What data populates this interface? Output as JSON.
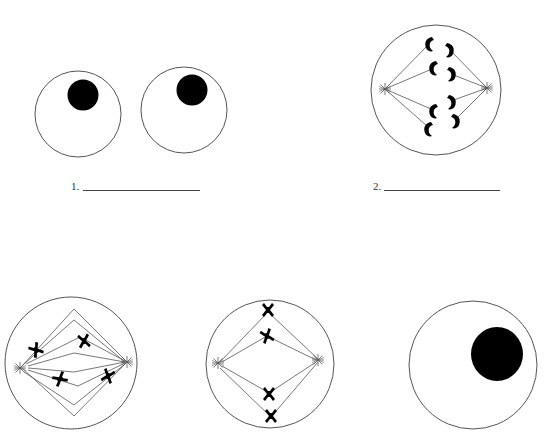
{
  "worksheet": {
    "title": "Stages of cell division",
    "labels": [
      {
        "number": "1.",
        "answer_blank": ""
      },
      {
        "number": "2.",
        "answer_blank": ""
      }
    ]
  },
  "cells": [
    {
      "id": "cell-1a",
      "stage_hint": "interphase",
      "has_nucleus": true
    },
    {
      "id": "cell-1b",
      "stage_hint": "interphase",
      "has_nucleus": true
    },
    {
      "id": "cell-2",
      "stage_hint": "anaphase",
      "chromosomes": 8,
      "centrioles": 2
    },
    {
      "id": "cell-3",
      "stage_hint": "prometaphase",
      "chromosomes": 4,
      "centrioles": 2
    },
    {
      "id": "cell-4",
      "stage_hint": "metaphase",
      "chromosomes": 4,
      "centrioles": 2
    },
    {
      "id": "cell-5",
      "stage_hint": "interphase",
      "has_nucleus": true
    }
  ],
  "colors": {
    "outline": "#555555",
    "fill": "#000000",
    "background": "#ffffff"
  }
}
